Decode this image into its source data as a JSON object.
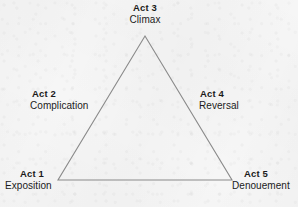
{
  "figure": {
    "shape": "triangle",
    "line_color": "#8a8a8a",
    "text_color": "#1b1b1b",
    "background_color": "#f6f6f6",
    "vertices": {
      "apex": {
        "x": 145,
        "y": 36
      },
      "bottom_left": {
        "x": 58,
        "y": 180
      },
      "bottom_right": {
        "x": 232,
        "y": 180
      }
    }
  },
  "labels": {
    "act3": {
      "act": "Act 3",
      "name": "Climax"
    },
    "act2": {
      "act": "Act 2",
      "name": "Complication"
    },
    "act4": {
      "act": "Act 4",
      "name": "Reversal"
    },
    "act1": {
      "act": "Act 1",
      "name": "Exposition"
    },
    "act5": {
      "act": "Act 5",
      "name": "Denouement"
    }
  }
}
